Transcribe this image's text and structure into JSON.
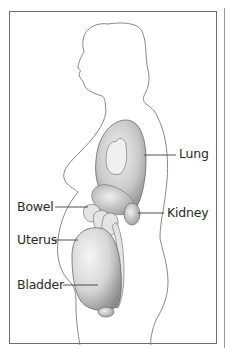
{
  "diagram": {
    "labels": [
      {
        "id": "lung",
        "text": "Lung"
      },
      {
        "id": "kidney",
        "text": "Kidney"
      },
      {
        "id": "bowel",
        "text": "Bowel"
      },
      {
        "id": "uterus",
        "text": "Uterus"
      },
      {
        "id": "bladder",
        "text": "Bladder"
      }
    ]
  },
  "colors": {
    "outline": "#7a7a7a",
    "frame": "#6f6f6f",
    "label_text": "#2a2a2a",
    "organ_shade_dark": "#8a8a8a",
    "organ_shade_light": "#d8d8d8"
  }
}
